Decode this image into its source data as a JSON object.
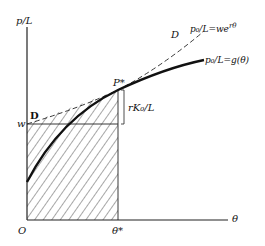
{
  "diagram": {
    "y_axis_label": "p/L",
    "x_axis_label": "θ",
    "origin_label": "O",
    "theta_star_label": "θ*",
    "w_label": "w",
    "d_label_left": "D",
    "d_label_top": "D",
    "p_star_label": "P*",
    "bracket_label": "rK₀/L",
    "dashed_curve_label": "p₀/L=we^{rθ}",
    "dashed_curve_label_main": "p₀/L=we",
    "dashed_curve_label_sup": "rθ",
    "solid_curve_label": "p₀/L=g(θ)"
  }
}
